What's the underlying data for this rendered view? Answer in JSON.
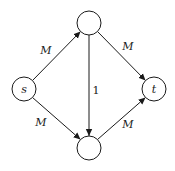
{
  "graph": {
    "nodes": [
      {
        "id": "s",
        "label": "s",
        "cx": 24,
        "cy": 89,
        "r": 12
      },
      {
        "id": "top",
        "label": "",
        "cx": 89,
        "cy": 23,
        "r": 12
      },
      {
        "id": "t",
        "label": "t",
        "cx": 154,
        "cy": 89,
        "r": 12
      },
      {
        "id": "bottom",
        "label": "",
        "cx": 89,
        "cy": 148,
        "r": 12
      }
    ],
    "edges": [
      {
        "from": "s",
        "to": "top",
        "label": "M"
      },
      {
        "from": "s",
        "to": "bottom",
        "label": "M"
      },
      {
        "from": "top",
        "to": "t",
        "label": "M"
      },
      {
        "from": "bottom",
        "to": "t",
        "label": "M"
      },
      {
        "from": "top",
        "to": "bottom",
        "label": "1"
      }
    ]
  },
  "labels": {
    "node_s": "s",
    "node_t": "t",
    "edge_s_top": "M",
    "edge_s_bottom": "M",
    "edge_top_t": "M",
    "edge_bottom_t": "M",
    "edge_top_bottom": "1"
  },
  "colors": {
    "stroke": "#1a1a1a",
    "background": "#ffffff"
  }
}
